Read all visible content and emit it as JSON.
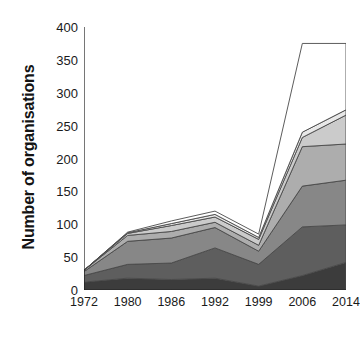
{
  "chart_data": {
    "type": "area",
    "title": "",
    "xlabel": "",
    "ylabel": "Number of organisations",
    "categories": [
      "1972",
      "1980",
      "1986",
      "1992",
      "1999",
      "2006",
      "2014"
    ],
    "x": [
      1972,
      1980,
      1986,
      1992,
      1999,
      2006,
      2014
    ],
    "ylim": [
      0,
      400
    ],
    "yticks": [
      0,
      50,
      100,
      150,
      200,
      250,
      300,
      350,
      400
    ],
    "ytick_labels": [
      "0",
      "50",
      "100",
      "150",
      "200",
      "250",
      "300",
      "350",
      "400"
    ],
    "grid": false,
    "legend": "none",
    "stacked": true,
    "series": [
      {
        "name": "series-1",
        "color": "#3c3c3c",
        "values": [
          12,
          18,
          16,
          18,
          6,
          22,
          42
        ]
      },
      {
        "name": "series-2",
        "color": "#5e5e5e",
        "values": [
          10,
          21,
          25,
          46,
          33,
          74,
          57
        ]
      },
      {
        "name": "series-3",
        "color": "#878787",
        "values": [
          6,
          35,
          38,
          31,
          20,
          62,
          68
        ]
      },
      {
        "name": "series-4",
        "color": "#adadad",
        "values": [
          2,
          9,
          10,
          8,
          9,
          60,
          55
        ]
      },
      {
        "name": "series-5",
        "color": "#cbcbcb",
        "values": [
          0,
          3,
          9,
          8,
          9,
          14,
          44
        ]
      },
      {
        "name": "series-6",
        "color": "#e8e8e8",
        "values": [
          0,
          1,
          3,
          4,
          3,
          8,
          8
        ]
      },
      {
        "name": "series-7",
        "color": "#ffffff",
        "values": [
          0,
          1,
          4,
          5,
          5,
          135,
          101
        ]
      }
    ],
    "totals": [
      30,
      88,
      105,
      120,
      85,
      375,
      375
    ],
    "axis_color": "#1a1a1a",
    "outline_color": "#4a4a4a",
    "background": "#ffffff"
  }
}
